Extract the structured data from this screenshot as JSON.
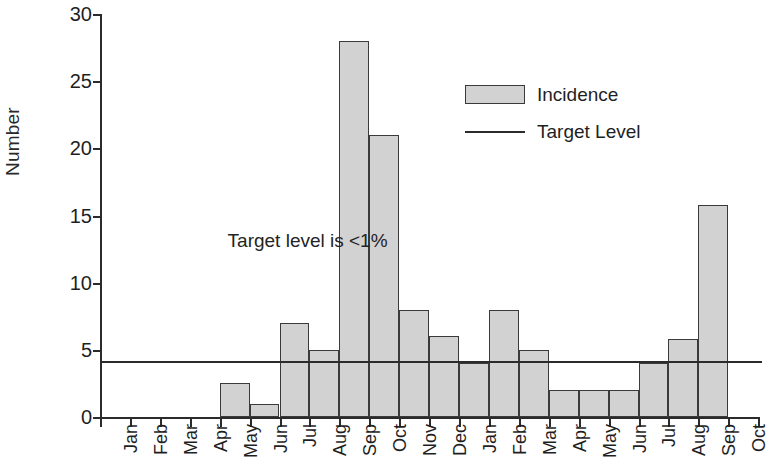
{
  "chart_data": {
    "type": "bar",
    "title": "",
    "subtitle": "",
    "xlabel": "",
    "ylabel": "Number",
    "ylim": [
      0,
      30
    ],
    "yticks": [
      0,
      5,
      10,
      15,
      20,
      25,
      30
    ],
    "grid": false,
    "legend_position": "inside-upper-right",
    "categories": [
      "Jan",
      "Feb",
      "Mar",
      "Apr",
      "May",
      "Jun",
      "Jul",
      "Aug",
      "Sep",
      "Oct",
      "Nov",
      "Dec",
      "Jan",
      "Feb",
      "Mar",
      "Apr",
      "May",
      "Jun",
      "Jul",
      "Aug",
      "Sep",
      "Oct"
    ],
    "series": [
      {
        "name": "Incidence",
        "type": "bar",
        "color": "#d2d2d2",
        "edge_color": "#3a3a3a",
        "values": [
          0,
          0,
          0,
          0,
          2.5,
          1,
          7,
          5,
          28,
          21,
          8,
          6,
          4,
          8,
          5,
          2,
          2,
          2,
          4,
          5.8,
          15.8,
          0
        ]
      },
      {
        "name": "Target Level",
        "type": "hline",
        "color": "#2b2b2b",
        "value": 4.2
      }
    ],
    "annotations": [
      {
        "text": "Target level is <1%",
        "x_category": "Jun",
        "y_value": 13
      }
    ]
  },
  "axes": {
    "y_title": "Number",
    "y_tick_labels": [
      "30",
      "25",
      "20",
      "15",
      "10",
      "5",
      "0"
    ]
  },
  "legend": {
    "items": [
      {
        "label": "Incidence",
        "marker": "filled-rect-swatch"
      },
      {
        "label": "Target Level",
        "marker": "solid-line-swatch"
      }
    ]
  },
  "annotation": {
    "target_note": "Target level is <1%"
  },
  "colors": {
    "bar_fill": "#d2d2d2",
    "bar_edge": "#3a3a3a",
    "axis": "#2b2b2b",
    "text": "#1f1f1f",
    "background": "#ffffff"
  }
}
